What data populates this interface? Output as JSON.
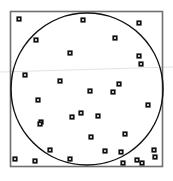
{
  "figure": {
    "title": "",
    "background_color": "#ffffff",
    "width": 173,
    "height": 181
  },
  "frame": {
    "name": "plot-frame",
    "x": 10.5,
    "y": 11.5,
    "width": 152,
    "height": 155,
    "stroke_color": "#6e6e6e",
    "stroke_width": 1.6,
    "fill": "none"
  },
  "circle": {
    "name": "boundary-circle",
    "cx": 87,
    "cy": 89,
    "r": 76,
    "stroke_color": "#111111",
    "stroke_width": 1.5,
    "fill": "none"
  },
  "guide_line": {
    "name": "horizontal-guide-line",
    "x1": 0,
    "y1": 72,
    "x2": 173,
    "y2": 67,
    "stroke_color": "#e2e2e2",
    "stroke_width": 1.2
  },
  "marker_style": {
    "shape": "square-outline",
    "size": 5.2,
    "outer_color": "#101010",
    "inner_color": "#f2f2f2",
    "inner_size": 1.8
  },
  "chart_data": {
    "type": "scatter",
    "title": "",
    "xlabel": "",
    "ylabel": "",
    "xlim": [
      0,
      173
    ],
    "ylim": [
      0,
      181
    ],
    "grid": false,
    "legend": null,
    "y_axis_inverted": true,
    "n_points": 33,
    "series": [
      {
        "name": "points",
        "marker": "square",
        "color": "#101010",
        "points": [
          {
            "x": 19,
            "y": 19
          },
          {
            "x": 83,
            "y": 20
          },
          {
            "x": 139,
            "y": 23
          },
          {
            "x": 36,
            "y": 40
          },
          {
            "x": 115,
            "y": 38
          },
          {
            "x": 70,
            "y": 53
          },
          {
            "x": 139,
            "y": 56
          },
          {
            "x": 141,
            "y": 64
          },
          {
            "x": 25,
            "y": 75
          },
          {
            "x": 60,
            "y": 81
          },
          {
            "x": 119,
            "y": 84
          },
          {
            "x": 90,
            "y": 91
          },
          {
            "x": 113,
            "y": 92
          },
          {
            "x": 38,
            "y": 100
          },
          {
            "x": 148,
            "y": 105
          },
          {
            "x": 81,
            "y": 113
          },
          {
            "x": 72,
            "y": 117
          },
          {
            "x": 98,
            "y": 116
          },
          {
            "x": 41,
            "y": 122
          },
          {
            "x": 40,
            "y": 124
          },
          {
            "x": 91,
            "y": 137
          },
          {
            "x": 125,
            "y": 134
          },
          {
            "x": 50,
            "y": 150
          },
          {
            "x": 121,
            "y": 152
          },
          {
            "x": 154,
            "y": 150
          },
          {
            "x": 15,
            "y": 159
          },
          {
            "x": 35,
            "y": 161
          },
          {
            "x": 70,
            "y": 159
          },
          {
            "x": 137,
            "y": 160
          },
          {
            "x": 123,
            "y": 163
          },
          {
            "x": 142,
            "y": 163
          },
          {
            "x": 155,
            "y": 157
          },
          {
            "x": 105,
            "y": 151
          }
        ]
      }
    ]
  }
}
